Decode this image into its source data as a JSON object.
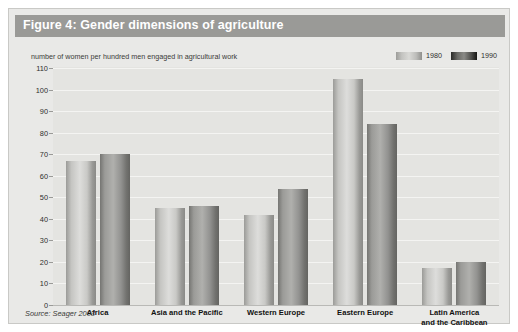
{
  "figure": {
    "title": "Figure 4: Gender dimensions of agriculture",
    "subtitle": "number of women per hundred men engaged in agricultural work",
    "source": "Source: Seager 2003"
  },
  "legend": {
    "items": [
      {
        "label": "1980",
        "swatch": "light-gradient-swatch"
      },
      {
        "label": "1990",
        "swatch": "dark-gradient-swatch"
      }
    ]
  },
  "chart_data": {
    "type": "bar",
    "title": "Figure 4: Gender dimensions of agriculture",
    "subtitle": "number of women per hundred men engaged in agricultural work",
    "xlabel": "",
    "ylabel": "number of women per hundred men engaged in agricultural work",
    "ylim": [
      0,
      110
    ],
    "yticks": [
      0,
      10,
      20,
      30,
      40,
      50,
      60,
      70,
      80,
      90,
      100,
      110
    ],
    "ytick_labels": [
      "0",
      "10",
      "20",
      "30",
      "40",
      "50",
      "60",
      "70",
      "80",
      "90",
      "100",
      "110"
    ],
    "grid": true,
    "legend_position": "top-right",
    "categories": [
      "Africa",
      "Asia and the Pacific",
      "Western Europe",
      "Eastern Europe",
      "Latin America and the Caribbean"
    ],
    "category_lines": [
      [
        "Africa"
      ],
      [
        "Asia and the Pacific"
      ],
      [
        "Western Europe"
      ],
      [
        "Eastern Europe"
      ],
      [
        "Latin America",
        "and the Caribbean"
      ]
    ],
    "series": [
      {
        "name": "1980",
        "values": [
          67,
          45,
          42,
          105,
          17
        ]
      },
      {
        "name": "1990",
        "values": [
          70,
          46,
          54,
          84,
          20
        ]
      }
    ],
    "source": "Source: Seager 2003"
  },
  "colors": {
    "title_bar": "#9a9a97",
    "panel_background": "#e9e9e7",
    "plot_background": "#e4e4e1",
    "gridline": "#f4f4f2",
    "baseline": "#b9b9b6",
    "bar_1980": "#d5d5d2",
    "bar_1990": "#8e8e8b",
    "title_text": "#ffffff",
    "body_text": "#2f2f2d"
  }
}
